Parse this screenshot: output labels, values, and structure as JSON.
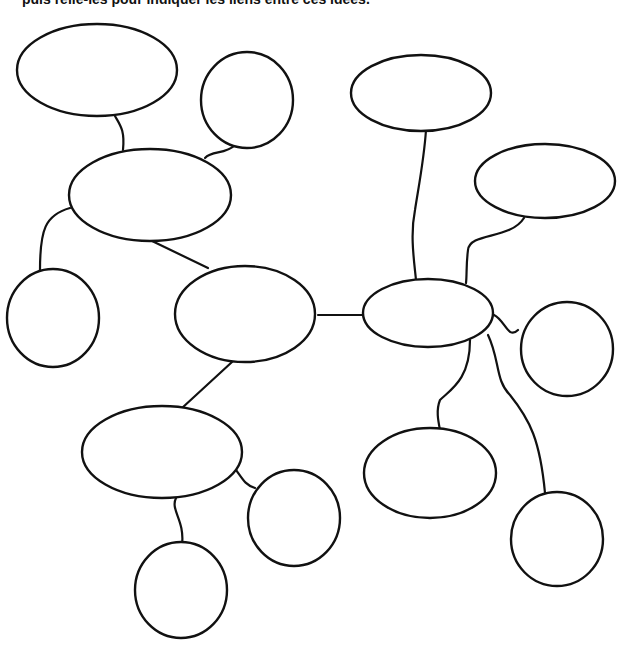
{
  "instruction": "puis relie-les pour indiquer les liens entre ces idées.",
  "diagram": {
    "type": "mind-map",
    "nodes": [
      {
        "id": "n1",
        "shape": "ellipse",
        "label": ""
      },
      {
        "id": "n2",
        "shape": "circle",
        "label": ""
      },
      {
        "id": "n3",
        "shape": "ellipse",
        "label": ""
      },
      {
        "id": "n4",
        "shape": "circle",
        "label": ""
      },
      {
        "id": "n5",
        "shape": "ellipse",
        "label": ""
      },
      {
        "id": "n6",
        "shape": "ellipse",
        "label": ""
      },
      {
        "id": "n7",
        "shape": "circle",
        "label": ""
      },
      {
        "id": "n8",
        "shape": "circle",
        "label": ""
      },
      {
        "id": "n9",
        "shape": "ellipse",
        "label": ""
      },
      {
        "id": "n10",
        "shape": "ellipse",
        "label": ""
      },
      {
        "id": "n11",
        "shape": "ellipse",
        "label": ""
      },
      {
        "id": "n12",
        "shape": "circle",
        "label": ""
      },
      {
        "id": "n13",
        "shape": "ellipse",
        "label": ""
      },
      {
        "id": "n14",
        "shape": "circle",
        "label": ""
      }
    ]
  }
}
